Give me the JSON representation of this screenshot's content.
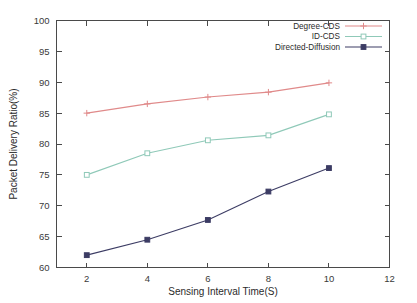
{
  "chart_data": {
    "type": "line",
    "title": "",
    "xlabel": "Sensing Interval Time(S)",
    "ylabel": "Packet Delivery Ratio(%)",
    "x": [
      2,
      4,
      6,
      8,
      10
    ],
    "xlim": [
      1,
      12
    ],
    "ylim": [
      60,
      100
    ],
    "xticks": [
      2,
      4,
      6,
      8,
      10,
      12
    ],
    "yticks": [
      60,
      65,
      70,
      75,
      80,
      85,
      90,
      95,
      100
    ],
    "xtick_labels": [
      "2",
      "4",
      "6",
      "8",
      "10",
      "12"
    ],
    "ytick_labels": [
      "60",
      "65",
      "70",
      "75",
      "80",
      "85",
      "90",
      "95",
      "100"
    ],
    "grid": false,
    "legend_position": "top-right",
    "series": [
      {
        "name": "Degree-CDS",
        "color": "#e08a8a",
        "marker": "plus",
        "values": [
          85.0,
          86.5,
          87.6,
          88.4,
          89.9
        ]
      },
      {
        "name": "ID-CDS",
        "color": "#8fc9b8",
        "marker": "square-open",
        "values": [
          75.0,
          78.5,
          80.6,
          81.4,
          84.8
        ]
      },
      {
        "name": "Directed-Diffusion",
        "color": "#3c3c64",
        "marker": "square-filled",
        "values": [
          62.0,
          64.5,
          67.7,
          72.3,
          76.1
        ]
      }
    ]
  },
  "figure": {
    "background": "#ffffff",
    "axis_color": "#4a4a4a"
  }
}
